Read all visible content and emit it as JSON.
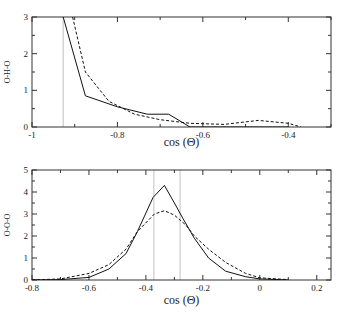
{
  "chart_data": [
    {
      "type": "line",
      "title": "",
      "xlabel": "cos (Θ)",
      "ylabel": "O-H-O",
      "xlim": [
        -1,
        -0.3
      ],
      "ylim": [
        0,
        3
      ],
      "xticks": [
        "-1",
        "-0.8",
        "-0.6",
        "-0.4"
      ],
      "xtick_values": [
        -1,
        -0.8,
        -0.6,
        -0.4
      ],
      "yticks": [
        "0",
        "1",
        "2",
        "3"
      ],
      "ytick_values": [
        0,
        1,
        2,
        3
      ],
      "grid": false,
      "vlines": [
        -0.927
      ],
      "series": [
        {
          "name": "solid",
          "style": "solid",
          "x": [
            -0.927,
            -0.875,
            -0.8,
            -0.73,
            -0.68,
            -0.63,
            -0.4
          ],
          "y": [
            3.0,
            0.85,
            0.55,
            0.35,
            0.35,
            0.0,
            0.0
          ]
        },
        {
          "name": "dashed",
          "style": "dashed",
          "x": [
            -0.905,
            -0.875,
            -0.82,
            -0.76,
            -0.7,
            -0.63,
            -0.55,
            -0.47,
            -0.4,
            -0.37
          ],
          "y": [
            3.0,
            1.5,
            0.7,
            0.35,
            0.2,
            0.1,
            0.07,
            0.18,
            0.1,
            0.0
          ]
        }
      ]
    },
    {
      "type": "line",
      "title": "",
      "xlabel": "cos (Θ)",
      "ylabel": "O-O-O",
      "xlim": [
        -0.8,
        0.25
      ],
      "ylim": [
        0,
        5
      ],
      "xticks": [
        "-0.8",
        "-0.6",
        "-0.4",
        "-0.2",
        "0",
        "0.2"
      ],
      "xtick_values": [
        -0.8,
        -0.6,
        -0.4,
        -0.2,
        0,
        0.2
      ],
      "yticks": [
        "0",
        "1",
        "2",
        "3",
        "4",
        "5"
      ],
      "ytick_values": [
        0,
        1,
        2,
        3,
        4,
        5
      ],
      "grid": false,
      "vlines": [
        -0.372,
        -0.28
      ],
      "series": [
        {
          "name": "solid",
          "style": "solid",
          "x": [
            -0.8,
            -0.7,
            -0.6,
            -0.53,
            -0.47,
            -0.43,
            -0.375,
            -0.335,
            -0.3,
            -0.27,
            -0.23,
            -0.18,
            -0.12,
            -0.05,
            0,
            0.1
          ],
          "y": [
            0,
            0.02,
            0.12,
            0.5,
            1.2,
            2.2,
            3.75,
            4.3,
            3.5,
            2.8,
            1.9,
            1.0,
            0.4,
            0.15,
            0.05,
            0.0
          ]
        },
        {
          "name": "dashed",
          "style": "dashed",
          "x": [
            -0.8,
            -0.7,
            -0.6,
            -0.53,
            -0.47,
            -0.43,
            -0.37,
            -0.335,
            -0.3,
            -0.26,
            -0.23,
            -0.18,
            -0.12,
            -0.05,
            0,
            0.1
          ],
          "y": [
            0,
            0.05,
            0.3,
            0.7,
            1.4,
            2.2,
            3.0,
            3.15,
            2.95,
            2.5,
            2.0,
            1.4,
            0.8,
            0.3,
            0.1,
            0.02
          ]
        }
      ]
    }
  ],
  "layout": [
    {
      "left": 32,
      "right": 331,
      "top": 17,
      "bottom": 127,
      "xlabel_y": 146,
      "ylabel_x": 10
    },
    {
      "left": 32,
      "right": 331,
      "top": 170,
      "bottom": 280,
      "xlabel_y": 304,
      "ylabel_x": 10
    }
  ],
  "colors": {
    "line": "#111111",
    "vline": "#b0b0b0",
    "axis": "#333333"
  }
}
